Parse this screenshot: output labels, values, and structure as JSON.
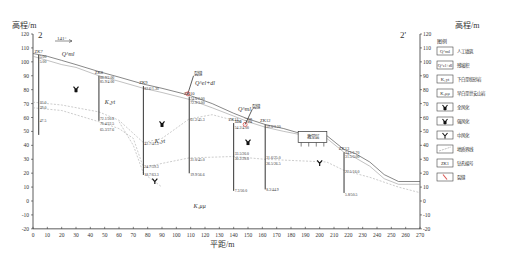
{
  "title_left": "2",
  "title_right": "2'",
  "y_axis_label": "高程/m",
  "x_axis_label": "平距/m",
  "direction_label": "141°",
  "x_range": [
    0,
    270
  ],
  "y_range": [
    -20,
    120
  ],
  "x_ticks": [
    0,
    10,
    20,
    30,
    40,
    50,
    60,
    70,
    80,
    90,
    100,
    110,
    120,
    130,
    140,
    150,
    160,
    170,
    180,
    190,
    200,
    210,
    220,
    230,
    240,
    250,
    260,
    270
  ],
  "y_ticks": [
    120,
    110,
    100,
    90,
    80,
    70,
    60,
    50,
    40,
    30,
    20,
    10,
    0,
    -10,
    -20
  ],
  "colors": {
    "line": "#444444",
    "fault": "#d9534f",
    "boundary": "#aaaaaa",
    "text": "#333333"
  },
  "strata_labels": [
    {
      "text": "Q^ml",
      "x": 20,
      "y": 104
    },
    {
      "text": "Q^el+dl",
      "x": 113,
      "y": 83
    },
    {
      "text": "K₁yt",
      "x": 50,
      "y": 70
    },
    {
      "text": "K₁yt",
      "x": 85,
      "y": 42
    },
    {
      "text": "Q^ml",
      "x": 143,
      "y": 65
    },
    {
      "text": "K₁μμ",
      "x": 112,
      "y": -5
    }
  ],
  "weathering_symbols": [
    {
      "x": 30,
      "y": 80,
      "type": "strong"
    },
    {
      "x": 90,
      "y": 55,
      "type": "strong"
    },
    {
      "x": 85,
      "y": 14,
      "type": "medium"
    },
    {
      "x": 150,
      "y": 42,
      "type": "strong"
    },
    {
      "x": 200,
      "y": 27,
      "type": "medium"
    }
  ],
  "boreholes": [
    {
      "id": "ZK7",
      "x": 4,
      "top": 105.0,
      "bottom": 47.5,
      "labels": [
        {
          "text": "5.00",
          "y": 104
        },
        {
          "text": "5.00",
          "y": 100
        },
        {
          "text": "33.0",
          "y": 70.5
        },
        {
          "text": "39.0",
          "y": 67.5
        },
        {
          "text": "47.5",
          "y": 58
        }
      ]
    },
    {
      "id": "ZK8",
      "x": 46,
      "top": 90,
      "bottom": 57.6,
      "labels": [
        {
          "text": "88.9/2.00",
          "y": 89
        },
        {
          "text": "85.9/4.00",
          "y": 86
        },
        {
          "text": "72.1/30.8",
          "y": 59
        },
        {
          "text": "70.4/32.5",
          "y": 55.5
        },
        {
          "text": "65.3/37.6",
          "y": 51.5
        }
      ]
    },
    {
      "id": "ZK9",
      "x": 77,
      "top": 82.6,
      "bottom": 18.7,
      "labels": [
        {
          "text": "82.6/1.30",
          "y": 81
        },
        {
          "text": "42.7/41.3",
          "y": 41
        },
        {
          "text": "24.7/59.3",
          "y": 25
        },
        {
          "text": "18.7/63.3",
          "y": 19
        }
      ]
    },
    {
      "id": "ZK10",
      "x": 109,
      "top": 75,
      "bottom": 19.9,
      "labels": [
        {
          "text": "74.0/2.00",
          "y": 74
        },
        {
          "text": "72.9/3.00",
          "y": 71
        },
        {
          "text": "61.2/45.3",
          "y": 58.5
        },
        {
          "text": "31.0/45.0",
          "y": 30
        },
        {
          "text": "19.9/56.6",
          "y": 19
        }
      ]
    },
    {
      "id": "ZK11",
      "x": 140,
      "top": 56,
      "bottom": 7.3,
      "labels": [
        {
          "text": "52.6",
          "y": 57
        },
        {
          "text": "7.90",
          "y": 57
        },
        {
          "text": "54.2/4.00",
          "y": 53
        },
        {
          "text": "33.5/26.0",
          "y": 34
        },
        {
          "text": "30.2/28.0",
          "y": 30.5
        },
        {
          "text": "7.3/50.0",
          "y": 7.5
        }
      ]
    },
    {
      "id": "ZK12",
      "x": 162,
      "top": 55,
      "bottom": 8.3,
      "labels": [
        {
          "text": "59.0/3.20",
          "y": 53.5
        },
        {
          "text": "31.6/25.0",
          "y": 31
        },
        {
          "text": "26.5/26.5",
          "y": 27
        },
        {
          "text": "8.3/44.9",
          "y": 8
        }
      ]
    },
    {
      "id": "ZK13",
      "x": 217,
      "top": 35,
      "bottom": 5.8,
      "labels": [
        {
          "text": "34.1/1.70",
          "y": 35
        },
        {
          "text": "31.5/3.00",
          "y": 32
        },
        {
          "text": "22.5/16.0",
          "y": 21.5
        },
        {
          "text": "5.8/50.5",
          "y": 5
        }
      ]
    }
  ],
  "faults": [
    {
      "label": "裂缝",
      "x1": 112,
      "y1": 90,
      "x2": 108,
      "y2": 77
    },
    {
      "label": "裂缝",
      "x1": 153,
      "y1": 66,
      "x2": 148,
      "y2": 55
    }
  ],
  "annotation_sanduan": {
    "text": "三段",
    "x": 147,
    "y": 57
  },
  "building": {
    "label": "教堂层",
    "x1": 185,
    "x2": 205,
    "top": 50,
    "bottom": 42
  },
  "legend": {
    "title": "图例",
    "items": [
      {
        "symbol": "Q^ml",
        "label": "人工填筑"
      },
      {
        "symbol": "Q^el+dl",
        "label": "残坡积"
      },
      {
        "symbol": "K₁yt",
        "label": "下白垩统砂岩"
      },
      {
        "symbol": "K₁μμ",
        "label": "早白垩世安山岩"
      },
      {
        "symbol": "bat-strong",
        "label": "全风化"
      },
      {
        "symbol": "bat-strong2",
        "label": "强风化"
      },
      {
        "symbol": "bat-medium",
        "label": "中风化"
      },
      {
        "symbol": "boundary-line",
        "label": "地质界线"
      },
      {
        "symbol": "ZK1",
        "label": "钻孔编号"
      },
      {
        "symbol": "fault",
        "label": "裂缝"
      }
    ]
  },
  "ground_surface": [
    [
      0,
      106
    ],
    [
      10,
      104
    ],
    [
      20,
      101
    ],
    [
      30,
      98
    ],
    [
      46,
      93
    ],
    [
      60,
      89
    ],
    [
      77,
      84
    ],
    [
      90,
      81
    ],
    [
      109,
      76
    ],
    [
      125,
      70
    ],
    [
      140,
      63
    ],
    [
      150,
      59
    ],
    [
      162,
      55
    ],
    [
      175,
      52
    ],
    [
      185,
      49
    ],
    [
      205,
      47
    ],
    [
      217,
      37
    ],
    [
      225,
      34
    ],
    [
      235,
      28
    ],
    [
      245,
      19
    ],
    [
      255,
      14
    ],
    [
      270,
      14
    ]
  ],
  "ground_surface2": [
    [
      0,
      104
    ],
    [
      10,
      101
    ],
    [
      20,
      98
    ],
    [
      30,
      96
    ],
    [
      46,
      90
    ],
    [
      60,
      86
    ],
    [
      77,
      81
    ],
    [
      90,
      78
    ],
    [
      109,
      73
    ],
    [
      125,
      67
    ],
    [
      140,
      61
    ],
    [
      150,
      57
    ],
    [
      162,
      53
    ],
    [
      175,
      50
    ],
    [
      185,
      48
    ],
    [
      205,
      45
    ],
    [
      217,
      35
    ],
    [
      225,
      31
    ],
    [
      235,
      25
    ],
    [
      245,
      16
    ],
    [
      255,
      12
    ],
    [
      270,
      12
    ]
  ],
  "boundary_lines": [
    [
      [
        0,
        71
      ],
      [
        20,
        69
      ],
      [
        46,
        64
      ],
      [
        60,
        58
      ],
      [
        77,
        42
      ],
      [
        90,
        45
      ],
      [
        109,
        59
      ],
      [
        125,
        62
      ],
      [
        140,
        58
      ]
    ],
    [
      [
        0,
        67
      ],
      [
        20,
        65
      ],
      [
        46,
        57
      ],
      [
        60,
        52
      ],
      [
        70,
        45
      ],
      [
        77,
        24
      ],
      [
        90,
        27
      ],
      [
        109,
        31
      ],
      [
        140,
        32
      ],
      [
        162,
        30
      ],
      [
        205,
        28
      ],
      [
        217,
        22
      ],
      [
        235,
        17
      ],
      [
        255,
        10
      ],
      [
        270,
        6
      ]
    ],
    [
      [
        60,
        57
      ],
      [
        70,
        40
      ],
      [
        77,
        20
      ],
      [
        90,
        10
      ]
    ]
  ]
}
